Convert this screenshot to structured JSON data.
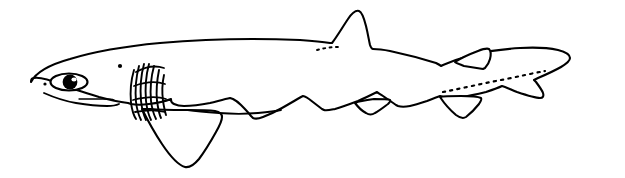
{
  "image": {
    "title": "Shark lateral-view line illustration",
    "subject": "shark",
    "style": "black ink line drawing",
    "orientation": "left-facing lateral view",
    "width": 625,
    "height": 178,
    "background_color": "#ffffff",
    "ink_color": "#000000"
  },
  "anatomy": {
    "parts": [
      {
        "id": "body",
        "label": "Body outline"
      },
      {
        "id": "head",
        "label": "Head"
      },
      {
        "id": "snout",
        "label": "Snout"
      },
      {
        "id": "eye",
        "label": "Eye"
      },
      {
        "id": "nostril",
        "label": "Nostril"
      },
      {
        "id": "spiracle",
        "label": "Spiracle"
      },
      {
        "id": "mouth",
        "label": "Mouth"
      },
      {
        "id": "gill-slits",
        "label": "Gill slits",
        "count": 6
      },
      {
        "id": "pectoral-fin",
        "label": "Pectoral fin"
      },
      {
        "id": "first-dorsal-fin",
        "label": "First dorsal fin"
      },
      {
        "id": "second-dorsal-fin",
        "label": "Second dorsal fin"
      },
      {
        "id": "pelvic-fin",
        "label": "Pelvic fin"
      },
      {
        "id": "anal-fin",
        "label": "Anal fin"
      },
      {
        "id": "caudal-fin",
        "label": "Caudal fin"
      },
      {
        "id": "lateral-line",
        "label": "Lateral line"
      }
    ]
  },
  "labels": {
    "caption": ""
  }
}
